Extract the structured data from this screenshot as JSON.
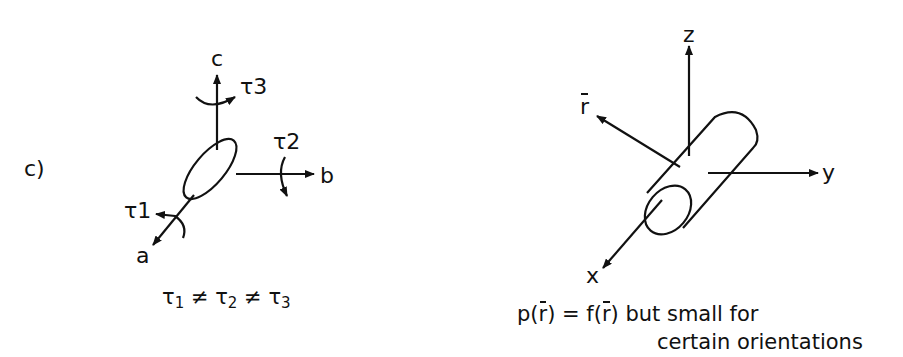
{
  "panel_label": "c)",
  "left_diagram": {
    "axes": {
      "a": "a",
      "b": "b",
      "c": "c"
    },
    "torques": {
      "t1": "τ",
      "t1_sub": "1",
      "t2": "τ",
      "t2_sub": "2",
      "t3": "τ",
      "t3_sub": "3"
    },
    "caption": {
      "t": "τ",
      "s1": "1",
      "s2": "2",
      "s3": "3",
      "neq": "≠"
    }
  },
  "right_diagram": {
    "axes": {
      "x": "x",
      "y": "y",
      "z": "z",
      "r": "r"
    },
    "caption": {
      "p": "p(",
      "r": "r",
      "close_eq": ") = f(",
      "close_rest": ") but small for",
      "line2": "certain orientations"
    }
  }
}
